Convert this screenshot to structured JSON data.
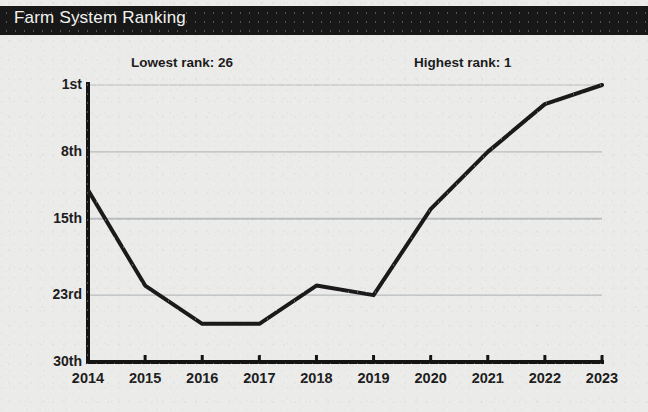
{
  "title": "Farm System Ranking",
  "annotations": {
    "lowest": "Lowest rank: 26",
    "highest": "Highest rank: 1"
  },
  "colors": {
    "title_bar": "#181818",
    "title_text": "#f2f2ef",
    "background": "#ebebea",
    "line": "#1a1a1a",
    "axis": "#141414",
    "gridline": "#b9bcbc"
  },
  "chart_data": {
    "type": "line",
    "title": "Farm System Ranking",
    "xlabel": "",
    "ylabel": "",
    "x": [
      2014,
      2015,
      2016,
      2017,
      2018,
      2019,
      2020,
      2021,
      2022,
      2023
    ],
    "categories": [
      "2014",
      "2015",
      "2016",
      "2017",
      "2018",
      "2019",
      "2020",
      "2021",
      "2022",
      "2023"
    ],
    "values": [
      12,
      22,
      26,
      26,
      22,
      23,
      14,
      8,
      3,
      1
    ],
    "series": [
      {
        "name": "Farm System Ranking",
        "values": [
          12,
          22,
          26,
          26,
          22,
          23,
          14,
          8,
          3,
          1
        ]
      }
    ],
    "ylim": [
      1,
      30
    ],
    "y_inverted": true,
    "ytick_values": [
      1,
      8,
      15,
      23,
      30
    ],
    "ytick_labels": [
      "1st",
      "8th",
      "15th",
      "23rd",
      "30th"
    ],
    "xtick_labels": [
      "2014",
      "2015",
      "2016",
      "2017",
      "2018",
      "2019",
      "2020",
      "2021",
      "2022",
      "2023"
    ],
    "grid": true,
    "legend": false,
    "annotations": [
      "Lowest rank: 26",
      "Highest rank: 1"
    ]
  }
}
